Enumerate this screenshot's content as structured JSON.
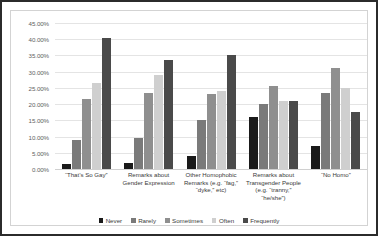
{
  "chart_data": {
    "type": "bar",
    "title": "",
    "subtitle": "",
    "xlabel": "",
    "ylabel": "",
    "ylim": [
      0,
      45
    ],
    "ytick_labels": [
      "45.00%",
      "40.00%",
      "35.00%",
      "30.00%",
      "25.00%",
      "20.00%",
      "15.00%",
      "10.00%",
      "5.00%",
      "0.00%"
    ],
    "ytick_values": [
      45,
      40,
      35,
      30,
      25,
      20,
      15,
      10,
      5,
      0
    ],
    "grid": true,
    "legend_position": "bottom",
    "categories": [
      "“That’s So Gay”",
      "Remarks about Gender Expression",
      "Other Homophobic Remarks (e.g. “fag,” “dyke,” etc)",
      "Remarks about Transgender People (e.g. “tranny,” “he/she”)",
      "“No Homo”"
    ],
    "series": [
      {
        "name": "Never",
        "color": "#1a1a1a",
        "values": [
          1.5,
          2.0,
          4.0,
          16.0,
          7.0
        ]
      },
      {
        "name": "Rarely",
        "color": "#7a7a7a",
        "values": [
          9.0,
          9.5,
          15.0,
          20.0,
          23.5
        ]
      },
      {
        "name": "Sometimes",
        "color": "#8f8f8f",
        "values": [
          21.5,
          23.5,
          23.0,
          25.5,
          31.0
        ]
      },
      {
        "name": "Often",
        "color": "#cfcfcf",
        "values": [
          26.5,
          29.0,
          24.0,
          21.0,
          25.0
        ]
      },
      {
        "name": "Frequently",
        "color": "#4a4a4a",
        "values": [
          40.5,
          33.5,
          35.0,
          21.0,
          17.5
        ]
      }
    ]
  }
}
